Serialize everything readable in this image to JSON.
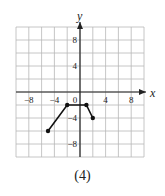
{
  "caption": "(4)",
  "chart_data": {
    "type": "line",
    "title": "",
    "xlabel": "x",
    "ylabel": "y",
    "xlim": [
      -10,
      10
    ],
    "ylim": [
      -10,
      10
    ],
    "grid": true,
    "grid_step": 2,
    "x_ticks": [
      -8,
      -4,
      0,
      4,
      8
    ],
    "y_ticks": [
      8,
      4,
      -4,
      -8
    ],
    "x_tick_labels": [
      "−8",
      "−4",
      "0",
      "4",
      "8"
    ],
    "y_tick_labels": [
      "8",
      "4",
      "−4",
      "−8"
    ],
    "series": [
      {
        "name": "piecewise",
        "points": [
          [
            -5,
            -6
          ],
          [
            -2,
            -2
          ],
          [
            1,
            -2
          ],
          [
            2,
            -4
          ]
        ],
        "markers": "closed-dots-at-vertices"
      }
    ],
    "colors": {
      "grid": "#b8b8b8",
      "axis": "#222222",
      "line": "#111111"
    }
  }
}
